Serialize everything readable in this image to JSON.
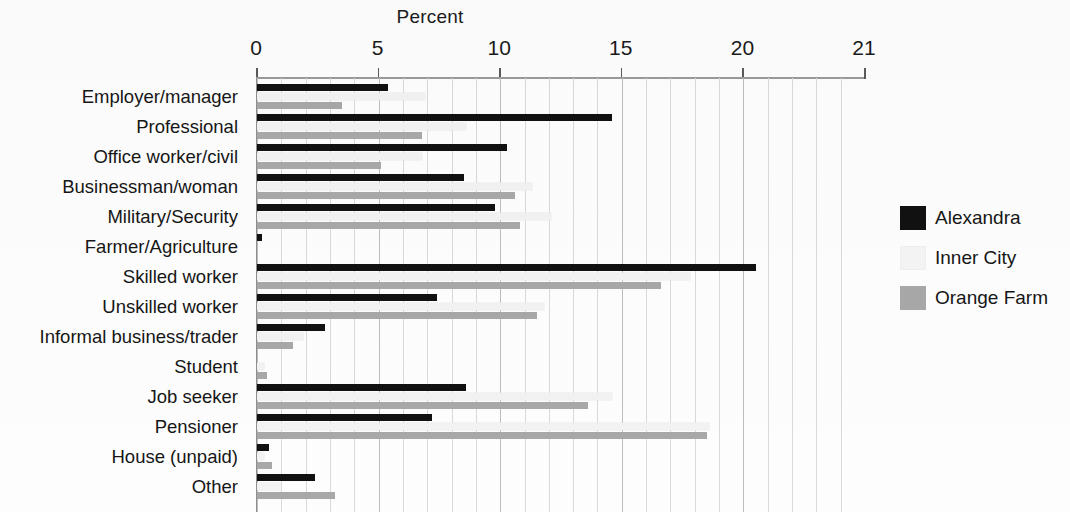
{
  "chart_data": {
    "type": "bar",
    "orientation": "horizontal",
    "title": "Percent",
    "xlabel": "Percent",
    "ylabel": "",
    "xlim": [
      0,
      25
    ],
    "grid": true,
    "legend_position": "right",
    "tick_labels": [
      "0",
      "5",
      "10",
      "15",
      "20",
      "21"
    ],
    "tick_values": [
      0,
      5,
      10,
      15,
      20,
      25
    ],
    "categories": [
      "Employer/manager",
      "Professional",
      "Office worker/civil",
      "Businessman/woman",
      "Military/Security",
      "Farmer/Agriculture",
      "Skilled worker",
      "Unskilled worker",
      "Informal business/trader",
      "Student",
      "Job seeker",
      "Pensioner",
      "House (unpaid)",
      "Other"
    ],
    "series": [
      {
        "name": "Alexandra",
        "color": "#111111",
        "values": [
          5.4,
          14.6,
          10.3,
          8.5,
          9.8,
          0.2,
          20.5,
          7.4,
          2.8,
          0.0,
          8.6,
          7.2,
          0.5,
          2.4
        ]
      },
      {
        "name": "Inner City",
        "color": "#f2f2f2",
        "values": [
          6.9,
          8.6,
          6.8,
          11.3,
          12.1,
          0.0,
          17.8,
          11.8,
          1.9,
          0.3,
          14.6,
          18.6,
          0.3,
          1.0
        ]
      },
      {
        "name": "Orange Farm",
        "color": "#a8a8a8",
        "values": [
          3.5,
          6.8,
          5.1,
          10.6,
          10.8,
          0.0,
          16.6,
          11.5,
          1.5,
          0.4,
          13.6,
          18.5,
          0.6,
          3.2
        ]
      }
    ]
  },
  "legend": {
    "items": [
      {
        "label": "Alexandra",
        "swatch": "alexandra"
      },
      {
        "label": "Inner City",
        "swatch": "innercity"
      },
      {
        "label": "Orange Farm",
        "swatch": "orangefarm"
      }
    ]
  }
}
